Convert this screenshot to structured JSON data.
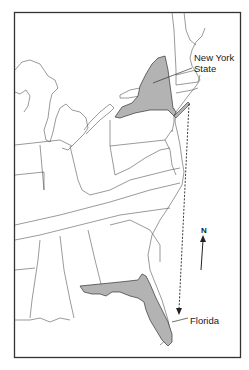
{
  "map": {
    "title": "",
    "region": "Eastern United States",
    "highlight_color": "#b3b3b3",
    "border_color": "#333333",
    "labels": {
      "new_york_line1": "New York",
      "new_york_line2": "State",
      "florida": "Florida",
      "north": "N"
    },
    "highlighted_states": [
      "New York State",
      "Florida"
    ],
    "annotations": [
      "dashed double-headed arrow from New York to Florida",
      "north arrow"
    ]
  }
}
